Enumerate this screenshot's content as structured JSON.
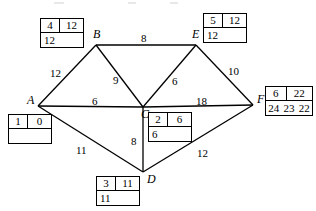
{
  "diagram": {
    "type": "weighted-graph",
    "nodes": [
      {
        "id": "A",
        "label": "A",
        "x": 38,
        "y": 106
      },
      {
        "id": "B",
        "label": "B",
        "x": 96,
        "y": 45
      },
      {
        "id": "C",
        "label": "C",
        "x": 143,
        "y": 107
      },
      {
        "id": "D",
        "label": "D",
        "x": 143,
        "y": 172
      },
      {
        "id": "E",
        "label": "E",
        "x": 196,
        "y": 45
      },
      {
        "id": "F",
        "label": "F",
        "x": 253,
        "y": 105
      }
    ],
    "edges": [
      {
        "from": "A",
        "to": "B",
        "weight": "12",
        "wx": 50,
        "wy": 68
      },
      {
        "from": "A",
        "to": "C",
        "weight": "6",
        "wx": 92,
        "wy": 96
      },
      {
        "from": "A",
        "to": "D",
        "weight": "11",
        "wx": 76,
        "wy": 145
      },
      {
        "from": "B",
        "to": "C",
        "weight": "9",
        "wx": 113,
        "wy": 75
      },
      {
        "from": "B",
        "to": "E",
        "weight": "8",
        "wx": 141,
        "wy": 33
      },
      {
        "from": "C",
        "to": "E",
        "weight": "6",
        "wx": 172,
        "wy": 76
      },
      {
        "from": "C",
        "to": "D",
        "weight": "8",
        "wx": 131,
        "wy": 136
      },
      {
        "from": "C",
        "to": "F",
        "weight": "18",
        "wx": 196,
        "wy": 96
      },
      {
        "from": "E",
        "to": "F",
        "weight": "10",
        "wx": 228,
        "wy": 66
      },
      {
        "from": "D",
        "to": "F",
        "weight": "12",
        "wx": 197,
        "wy": 148
      }
    ],
    "label_boxes": [
      {
        "node": "A",
        "name": "label-box-a",
        "x": 8,
        "y": 114,
        "width": 44,
        "order": "1",
        "final_label": "0",
        "working_values": [
          ""
        ]
      },
      {
        "node": "B",
        "name": "label-box-b",
        "x": 40,
        "y": 18,
        "width": 44,
        "order": "4",
        "final_label": "12",
        "working_values": [
          "12"
        ]
      },
      {
        "node": "C",
        "name": "label-box-c",
        "x": 148,
        "y": 112,
        "width": 44,
        "order": "2",
        "final_label": "6",
        "working_values": [
          "6"
        ]
      },
      {
        "node": "D",
        "name": "label-box-d",
        "x": 96,
        "y": 176,
        "width": 44,
        "order": "3",
        "final_label": "11",
        "working_values": [
          "11"
        ]
      },
      {
        "node": "E",
        "name": "label-box-e",
        "x": 203,
        "y": 13,
        "width": 44,
        "order": "5",
        "final_label": "12",
        "working_values": [
          "12"
        ]
      },
      {
        "node": "F",
        "name": "label-box-f",
        "x": 265,
        "y": 86,
        "width": 48,
        "order": "6",
        "final_label": "22",
        "working_values": [
          "24",
          "23",
          "22"
        ]
      }
    ],
    "colors": {
      "stroke": "#000000",
      "background": "#ffffff",
      "text": "#000000"
    }
  }
}
